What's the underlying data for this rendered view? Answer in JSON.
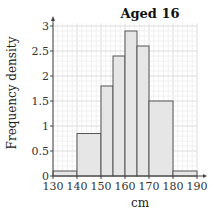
{
  "chart_data": {
    "type": "bar",
    "title": "Aged 16",
    "xlabel": "cm",
    "ylabel": "Frequency density",
    "histogram": true,
    "bins": [
      {
        "from": 130,
        "to": 140,
        "density": 0.1
      },
      {
        "from": 140,
        "to": 150,
        "density": 0.85
      },
      {
        "from": 150,
        "to": 155,
        "density": 1.8
      },
      {
        "from": 155,
        "to": 160,
        "density": 2.4
      },
      {
        "from": 160,
        "to": 165,
        "density": 2.9
      },
      {
        "from": 165,
        "to": 170,
        "density": 2.6
      },
      {
        "from": 170,
        "to": 180,
        "density": 1.5
      },
      {
        "from": 180,
        "to": 190,
        "density": 0.1
      }
    ],
    "x_ticks": [
      130,
      140,
      150,
      160,
      170,
      180,
      190
    ],
    "y_ticks": [
      0,
      0.5,
      1,
      1.5,
      2,
      2.5,
      3
    ],
    "xlim": [
      130,
      190
    ],
    "ylim": [
      0,
      3
    ],
    "grid": true,
    "bar_color": "#e6e6e6",
    "edge_color": "#555555"
  }
}
